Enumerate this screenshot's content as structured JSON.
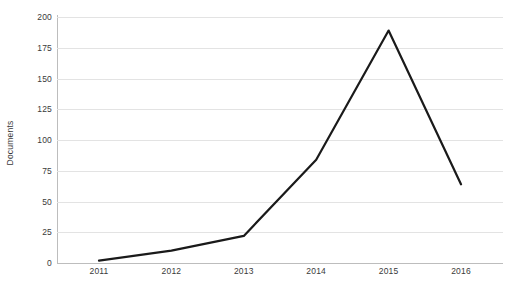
{
  "chart_data": {
    "type": "line",
    "title": "",
    "subtitle": "",
    "xlabel": "",
    "ylabel": "Documents",
    "categories": [
      "2011",
      "2012",
      "2013",
      "2014",
      "2015",
      "2016"
    ],
    "x": [
      2011,
      2012,
      2013,
      2014,
      2015,
      2016
    ],
    "values": [
      2,
      10,
      22,
      84,
      189,
      64
    ],
    "series": [
      {
        "name": "Documents",
        "values": [
          2,
          10,
          22,
          84,
          189,
          64
        ],
        "color": "#1a1a1a",
        "line_width": 2.2,
        "markers": false
      }
    ],
    "ylim": [
      0,
      200
    ],
    "yticks": [
      0,
      25,
      50,
      75,
      100,
      125,
      150,
      175,
      200
    ],
    "ytick_labels": [
      "0",
      "25",
      "50",
      "75",
      "100",
      "125",
      "150",
      "175",
      "200"
    ],
    "xtick_labels": [
      "2011",
      "2012",
      "2013",
      "2014",
      "2015",
      "2016"
    ],
    "grid": {
      "horizontal": true,
      "vertical": false,
      "color": "#e3e3e3"
    },
    "legend": {
      "visible": false,
      "position": "none",
      "entries": []
    },
    "axis_color": "#bdbdbd",
    "background_color": "#ffffff",
    "text_color": "#3a3a3a",
    "annotations": []
  }
}
